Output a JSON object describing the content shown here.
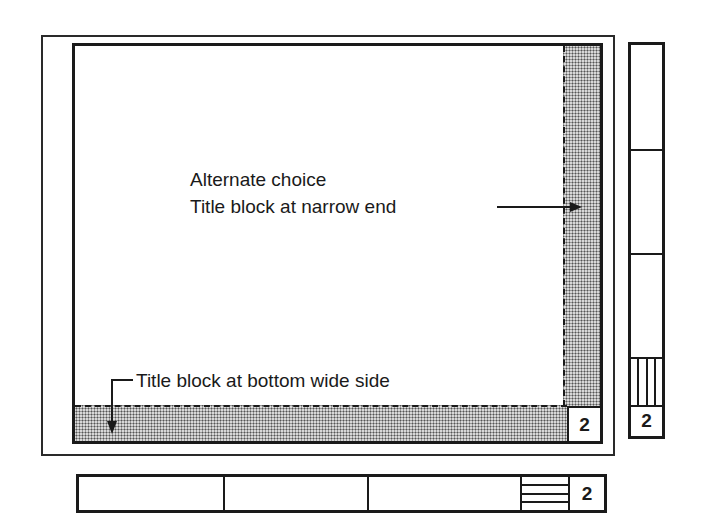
{
  "diagram": {
    "labels": {
      "alternate_line1": "Alternate choice",
      "alternate_line2": "Title block at narrow end",
      "bottom": "Title block at bottom wide side"
    },
    "sheet_number": "2",
    "vertical_title_block": {
      "number": "2",
      "sections": 3,
      "hatch_lines": 3
    },
    "horizontal_title_block": {
      "number": "2",
      "sections": 3,
      "hatch_lines": 3
    },
    "colors": {
      "line": "#1a1a1a",
      "shading": "#d8d8d8",
      "background": "#ffffff"
    }
  }
}
